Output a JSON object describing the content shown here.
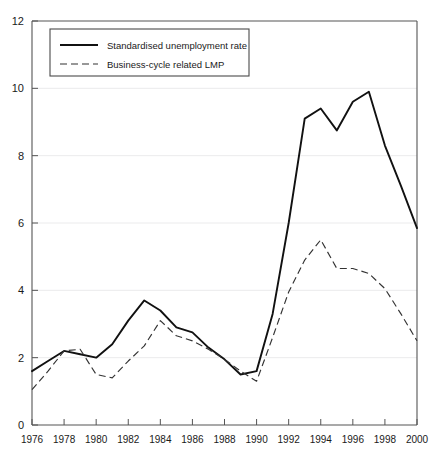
{
  "chart_data": {
    "type": "line",
    "title": "",
    "xlabel": "",
    "ylabel": "",
    "xlim": [
      1976,
      2000
    ],
    "ylim": [
      0,
      12
    ],
    "grid": true,
    "legend_position": "top-left",
    "x": [
      1976,
      1977,
      1978,
      1979,
      1980,
      1981,
      1982,
      1983,
      1984,
      1985,
      1986,
      1987,
      1988,
      1989,
      1990,
      1991,
      1992,
      1993,
      1994,
      1995,
      1996,
      1997,
      1998,
      1999,
      2000
    ],
    "xticks": [
      "1976",
      "1978",
      "1980",
      "1982",
      "1984",
      "1986",
      "1988",
      "1990",
      "1992",
      "1994",
      "1996",
      "1998",
      "2000"
    ],
    "yticks": [
      "0",
      "2",
      "4",
      "6",
      "8",
      "10",
      "12"
    ],
    "series": [
      {
        "name": "Standardised unemployment rate",
        "style": "solid",
        "color": "#111111",
        "values": [
          1.6,
          1.9,
          2.2,
          2.1,
          2.0,
          2.4,
          3.1,
          3.7,
          3.4,
          2.9,
          2.75,
          2.3,
          1.95,
          1.5,
          1.6,
          3.3,
          6.0,
          9.1,
          9.4,
          8.75,
          9.6,
          9.9,
          8.3,
          7.1,
          5.85
        ]
      },
      {
        "name": "Business-cycle related LMP",
        "style": "dashed",
        "color": "#333333",
        "values": [
          1.05,
          1.6,
          2.2,
          2.25,
          1.5,
          1.4,
          1.9,
          2.35,
          3.1,
          2.65,
          2.5,
          2.25,
          1.95,
          1.6,
          1.3,
          2.6,
          3.95,
          4.9,
          5.5,
          4.65,
          4.65,
          4.5,
          4.05,
          3.3,
          2.5
        ]
      }
    ]
  },
  "legend": {
    "entries": [
      {
        "label": "Standardised unemployment rate",
        "swatch": "solid-line-swatch"
      },
      {
        "label": "Business-cycle related LMP",
        "swatch": "dashed-line-swatch"
      }
    ]
  },
  "axes": {
    "y_tick_labels": [
      "12",
      "10",
      "8",
      "6",
      "4",
      "2",
      "0"
    ],
    "x_tick_labels": [
      "1976",
      "1978",
      "1980",
      "1982",
      "1984",
      "1986",
      "1988",
      "1990",
      "1992",
      "1994",
      "1996",
      "1998",
      "2000"
    ]
  }
}
